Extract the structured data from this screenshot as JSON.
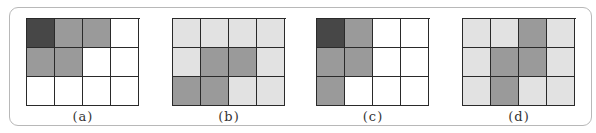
{
  "colors": {
    "dark": "#474747",
    "medium": "#9a9a9a",
    "light": "#e2e2e2",
    "white": "#ffffff",
    "grid_line": "#2a2a2a",
    "panel_border": "#b8b8b8"
  },
  "figures": [
    {
      "caption": "(a)",
      "cells": [
        [
          "dark",
          "medium",
          "medium",
          "white"
        ],
        [
          "medium",
          "medium",
          "white",
          "white"
        ],
        [
          "white",
          "white",
          "white",
          "white"
        ]
      ]
    },
    {
      "caption": "(b)",
      "cells": [
        [
          "light",
          "light",
          "light",
          "light"
        ],
        [
          "light",
          "medium",
          "medium",
          "light"
        ],
        [
          "medium",
          "medium",
          "light",
          "light"
        ]
      ]
    },
    {
      "caption": "(c)",
      "cells": [
        [
          "dark",
          "medium",
          "white",
          "white"
        ],
        [
          "medium",
          "medium",
          "white",
          "white"
        ],
        [
          "medium",
          "white",
          "white",
          "white"
        ]
      ]
    },
    {
      "caption": "(d)",
      "cells": [
        [
          "light",
          "light",
          "medium",
          "light"
        ],
        [
          "light",
          "medium",
          "medium",
          "light"
        ],
        [
          "light",
          "medium",
          "light",
          "light"
        ]
      ]
    }
  ]
}
